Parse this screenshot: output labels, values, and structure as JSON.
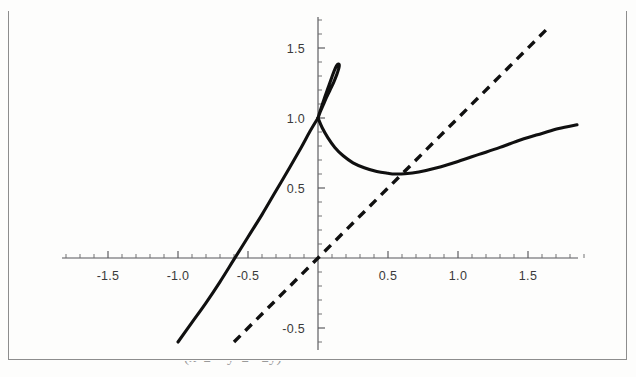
{
  "figure": {
    "caption": "(x^2 + y^2 - 2y)",
    "frame_color": "#8d8d8d",
    "background_color": "#fdfdfc"
  },
  "chart_data": {
    "type": "line",
    "title": "",
    "xlabel": "",
    "ylabel": "",
    "xlim": [
      -1.87,
      1.9
    ],
    "ylim": [
      -0.66,
      1.72
    ],
    "grid": false,
    "legend": "none",
    "axis_style": "crosshair-centered",
    "origin": [
      0,
      0
    ],
    "x_major_ticks": [
      -1.5,
      -1.0,
      -0.5,
      0.5,
      1.0,
      1.5
    ],
    "x_tick_labels": [
      "-1.5",
      "-1.0",
      "-0.5",
      "0.5",
      "1.0",
      "1.5"
    ],
    "y_major_ticks": [
      1.5,
      1.0,
      0.5,
      -0.5
    ],
    "y_tick_labels": [
      "1.5",
      "1.0",
      "0.5",
      "-0.5"
    ],
    "minor_tick_step": 0.1,
    "series": [
      {
        "name": "implicit-cubic-solid",
        "style": "solid",
        "color": "#101010",
        "description": "Solid cubic curve with a narrow loop; self-intersection at (0, 1.0), loop apex near (0.13, 1.38); left branch descends nearly linearly to (-1.0, -0.60); right branch has a minimum near (0.55, 0.60) and rises to (1.85, 0.95).",
        "loop_apex": [
          0.13,
          1.38
        ],
        "self_intersection": [
          0.0,
          1.0
        ],
        "right_branch_minimum": [
          0.55,
          0.6
        ],
        "points_left_branch": [
          [
            -1.0,
            -0.6
          ],
          [
            -0.9,
            -0.46
          ],
          [
            -0.8,
            -0.32
          ],
          [
            -0.7,
            -0.17
          ],
          [
            -0.6,
            -0.01
          ],
          [
            -0.5,
            0.15
          ],
          [
            -0.4,
            0.31
          ],
          [
            -0.3,
            0.48
          ],
          [
            -0.2,
            0.65
          ],
          [
            -0.12,
            0.79
          ],
          [
            -0.06,
            0.9
          ],
          [
            0.0,
            1.0
          ]
        ],
        "points_loop": [
          [
            0.0,
            1.0
          ],
          [
            0.022,
            1.07
          ],
          [
            0.045,
            1.14
          ],
          [
            0.07,
            1.21
          ],
          [
            0.095,
            1.28
          ],
          [
            0.115,
            1.335
          ],
          [
            0.132,
            1.372
          ],
          [
            0.146,
            1.385
          ],
          [
            0.152,
            1.378
          ],
          [
            0.148,
            1.352
          ],
          [
            0.134,
            1.31
          ],
          [
            0.112,
            1.255
          ],
          [
            0.086,
            1.2
          ],
          [
            0.06,
            1.145
          ],
          [
            0.036,
            1.09
          ],
          [
            0.015,
            1.042
          ],
          [
            0.0,
            1.0
          ]
        ],
        "points_right_branch": [
          [
            0.0,
            1.0
          ],
          [
            0.03,
            0.93
          ],
          [
            0.07,
            0.86
          ],
          [
            0.12,
            0.79
          ],
          [
            0.18,
            0.73
          ],
          [
            0.25,
            0.68
          ],
          [
            0.33,
            0.645
          ],
          [
            0.42,
            0.618
          ],
          [
            0.5,
            0.605
          ],
          [
            0.55,
            0.6
          ],
          [
            0.62,
            0.602
          ],
          [
            0.72,
            0.615
          ],
          [
            0.85,
            0.645
          ],
          [
            1.0,
            0.69
          ],
          [
            1.15,
            0.74
          ],
          [
            1.3,
            0.79
          ],
          [
            1.45,
            0.845
          ],
          [
            1.6,
            0.89
          ],
          [
            1.72,
            0.925
          ],
          [
            1.85,
            0.952
          ]
        ]
      },
      {
        "name": "asymptote-dashed-line",
        "style": "dashed",
        "color": "#101010",
        "description": "Dashed straight line of slope approximately 1 passing through the origin.",
        "slope": 1.0,
        "intercept": 0.0,
        "endpoints": [
          [
            -0.6,
            -0.6
          ],
          [
            1.66,
            1.66
          ]
        ]
      }
    ]
  }
}
